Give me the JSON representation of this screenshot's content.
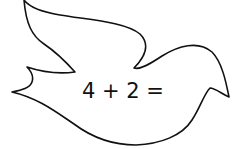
{
  "worksheet": {
    "shape": "dove-outline",
    "equation": "4 + 2 =",
    "outline_color": "#111111",
    "background_color": "#ffffff"
  }
}
